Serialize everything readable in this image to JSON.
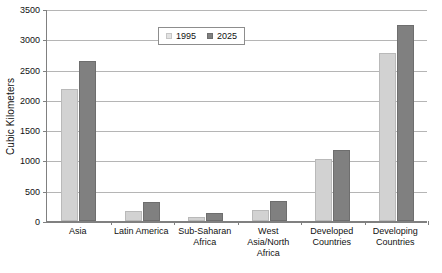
{
  "chart_data": {
    "type": "bar",
    "title": "",
    "xlabel": "",
    "ylabel": "Cubic Kilometers",
    "ylim": [
      0,
      3500
    ],
    "ytick_step": 500,
    "yticks": [
      0,
      500,
      1000,
      1500,
      2000,
      2500,
      3000,
      3500
    ],
    "ytick_labels": [
      "0",
      "500",
      "1000",
      "1500",
      "2000",
      "2500",
      "3000",
      "3500"
    ],
    "grid": true,
    "legend_position": "top-center",
    "categories": [
      "Asia",
      "Latin America",
      "Sub-Saharan Africa",
      "West Asia/North Africa",
      "Developed Countries",
      "Developing Countries"
    ],
    "category_lines": [
      [
        "Asia"
      ],
      [
        "Latin America"
      ],
      [
        "Sub-Saharan",
        "Africa"
      ],
      [
        "West Asia/North",
        "Africa"
      ],
      [
        "Developed",
        "Countries"
      ],
      [
        "Developing",
        "Countries"
      ]
    ],
    "series": [
      {
        "name": "1995",
        "color": "#d2d2d2",
        "values": [
          2180,
          160,
          65,
          190,
          1030,
          2770
        ]
      },
      {
        "name": "2025",
        "color": "#808080",
        "values": [
          2650,
          315,
          130,
          325,
          1165,
          3240
        ]
      }
    ]
  },
  "legend": {
    "entries": [
      {
        "label": "1995"
      },
      {
        "label": "2025"
      }
    ]
  },
  "colors": {
    "series_1995": "#d2d2d2",
    "series_2025": "#808080",
    "gridline": "#b5b5b5",
    "axis": "#808080",
    "text": "#111111",
    "background": "#ffffff"
  }
}
